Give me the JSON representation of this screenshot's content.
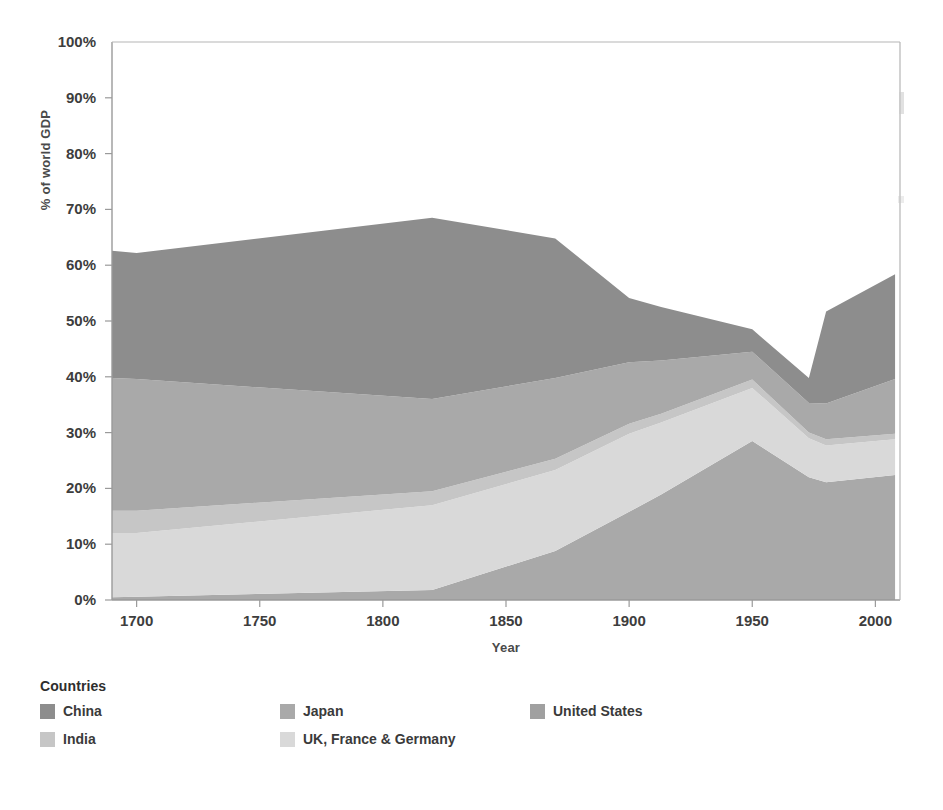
{
  "chart_data": {
    "type": "area",
    "stacked": true,
    "title": "",
    "xlabel": "Year",
    "ylabel": "% of world GDP",
    "xlim": [
      1690,
      2010
    ],
    "ylim": [
      0,
      100
    ],
    "xticks": [
      "1700",
      "1750",
      "1800",
      "1850",
      "1900",
      "1950",
      "2000"
    ],
    "xtick_values": [
      1700,
      1750,
      1800,
      1850,
      1900,
      1950,
      2000
    ],
    "yticks": [
      "0%",
      "10%",
      "20%",
      "30%",
      "40%",
      "50%",
      "60%",
      "70%",
      "80%",
      "90%",
      "100%"
    ],
    "ytick_values": [
      0,
      10,
      20,
      30,
      40,
      50,
      60,
      70,
      80,
      90,
      100
    ],
    "grid": false,
    "legend_position": "bottom",
    "legend_title": "Countries",
    "x": [
      1690,
      1700,
      1820,
      1870,
      1900,
      1913,
      1950,
      1973,
      1980,
      2008
    ],
    "series": [
      {
        "name": "United States",
        "color": "#a9a9a9",
        "values": [
          0.5,
          0.6,
          1.8,
          8.8,
          15.8,
          18.9,
          28.5,
          22.0,
          21.1,
          22.4
        ]
      },
      {
        "name": "UK, France & Germany",
        "color": "#d9d9d9",
        "values": [
          11.5,
          11.4,
          15.2,
          14.5,
          14.0,
          12.9,
          9.5,
          7.0,
          6.6,
          6.4
        ]
      },
      {
        "name": "India",
        "color": "#c6c6c6",
        "values": [
          4.0,
          4.0,
          2.5,
          2.0,
          1.8,
          1.6,
          1.5,
          1.0,
          1.1,
          1.0
        ]
      },
      {
        "name": "Japan",
        "color": "#a9a9a9",
        "values": [
          23.8,
          23.6,
          16.5,
          14.5,
          11.0,
          9.5,
          5.0,
          5.3,
          6.4,
          9.8
        ]
      },
      {
        "name": "China",
        "color": "#8d8d8d",
        "values": [
          22.8,
          22.6,
          32.5,
          25.0,
          11.5,
          9.6,
          4.0,
          4.5,
          16.5,
          18.8
        ]
      }
    ],
    "series_order_bottom_to_top": [
      "United States",
      "UK, France & Germany",
      "India",
      "Japan",
      "China"
    ],
    "boundaries_percent": {
      "note": "cumulative upper edge of each band, bottom-to-top, at each x",
      "us": [
        0.5,
        0.6,
        1.8,
        8.8,
        15.8,
        18.9,
        28.5,
        22.0,
        21.1,
        22.4
      ],
      "uk_fr_de": [
        12.0,
        12.0,
        17.0,
        23.3,
        29.8,
        31.8,
        38.0,
        29.0,
        27.7,
        28.8
      ],
      "india": [
        16.0,
        16.0,
        19.5,
        25.3,
        31.6,
        33.4,
        39.5,
        30.0,
        28.8,
        29.8
      ],
      "japan": [
        39.8,
        39.6,
        36.0,
        39.8,
        42.6,
        42.9,
        44.5,
        35.3,
        35.2,
        39.6
      ],
      "china": [
        62.6,
        62.2,
        68.5,
        64.8,
        54.1,
        52.5,
        48.5,
        39.8,
        51.7,
        58.4
      ]
    }
  },
  "legend": {
    "title": "Countries",
    "items": [
      {
        "label": "China",
        "color": "#8d8d8d"
      },
      {
        "label": "Japan",
        "color": "#a9a9a9"
      },
      {
        "label": "United States",
        "color": "#a0a0a0"
      },
      {
        "label": "India",
        "color": "#c6c6c6"
      },
      {
        "label": "UK, France & Germany",
        "color": "#d9d9d9"
      }
    ]
  },
  "axes": {
    "x_title": "Year",
    "y_title": "% of world GDP"
  }
}
